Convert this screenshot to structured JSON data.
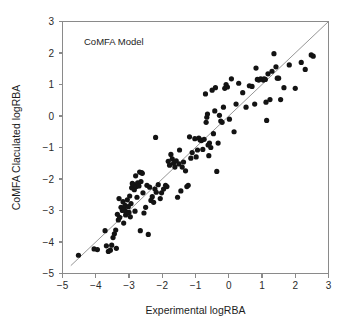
{
  "chart_data": {
    "type": "scatter",
    "title": "",
    "annotation": "CoMFA Model",
    "xlabel": "Experimental logRBA",
    "ylabel": "CoMFA Claculated logRBA",
    "xlim": [
      -5,
      3
    ],
    "ylim": [
      -5,
      3
    ],
    "xticks": [
      -5,
      -4,
      -3,
      -2,
      -1,
      0,
      1,
      2,
      3
    ],
    "yticks": [
      -5,
      -4,
      -3,
      -2,
      -1,
      0,
      1,
      2,
      3
    ],
    "xtick_labels": [
      "−5",
      "−4",
      "−3",
      "−2",
      "−1",
      "0",
      "1",
      "2",
      "3"
    ],
    "ytick_labels": [
      "−5",
      "−4",
      "−3",
      "−2",
      "−1",
      "0",
      "1",
      "2",
      "3"
    ],
    "grid": false,
    "legend": null,
    "point_color": "#131313",
    "line_color": "#8a8a8a",
    "axis_color": "#8a8a8a",
    "marker_size": 2.6,
    "reference_line": {
      "name": "identity-line",
      "slope": 1,
      "intercept": 0,
      "x_start": -4.75,
      "y_start": -4.75,
      "x_end": 3.0,
      "y_end": 3.0
    },
    "n_points": 146,
    "series": [
      {
        "name": "CoMFA predictions",
        "points": [
          [
            -4.52,
            -4.42
          ],
          [
            -4.05,
            -4.22
          ],
          [
            -3.95,
            -4.24
          ],
          [
            -3.72,
            -3.64
          ],
          [
            -3.68,
            -4.12
          ],
          [
            -3.62,
            -4.3
          ],
          [
            -3.56,
            -4.26
          ],
          [
            -3.52,
            -4.1
          ],
          [
            -3.48,
            -3.86
          ],
          [
            -3.44,
            -3.74
          ],
          [
            -3.4,
            -3.62
          ],
          [
            -3.38,
            -4.2
          ],
          [
            -3.35,
            -3.12
          ],
          [
            -3.32,
            -3.3
          ],
          [
            -3.3,
            -2.62
          ],
          [
            -3.28,
            -3.22
          ],
          [
            -3.24,
            -2.9
          ],
          [
            -3.2,
            -3.0
          ],
          [
            -3.18,
            -2.72
          ],
          [
            -3.16,
            -3.4
          ],
          [
            -3.14,
            -2.96
          ],
          [
            -3.12,
            -2.84
          ],
          [
            -3.1,
            -3.14
          ],
          [
            -3.08,
            -3.04
          ],
          [
            -3.05,
            -2.66
          ],
          [
            -3.02,
            -2.88
          ],
          [
            -3.0,
            -3.06
          ],
          [
            -2.98,
            -2.54
          ],
          [
            -2.96,
            -3.2
          ],
          [
            -2.94,
            -2.78
          ],
          [
            -2.92,
            -2.28
          ],
          [
            -2.9,
            -2.14
          ],
          [
            -2.88,
            -2.2
          ],
          [
            -2.86,
            -2.18
          ],
          [
            -2.84,
            -2.34
          ],
          [
            -2.82,
            -3.02
          ],
          [
            -2.8,
            -1.9
          ],
          [
            -2.78,
            -2.24
          ],
          [
            -2.76,
            -2.58
          ],
          [
            -2.74,
            -2.12
          ],
          [
            -2.72,
            -2.16
          ],
          [
            -2.7,
            -2.22
          ],
          [
            -2.68,
            -1.78
          ],
          [
            -2.66,
            -3.64
          ],
          [
            -2.64,
            -2.08
          ],
          [
            -2.62,
            -1.8
          ],
          [
            -2.6,
            -1.82
          ],
          [
            -2.58,
            -2.44
          ],
          [
            -2.55,
            -3.08
          ],
          [
            -2.5,
            -2.9
          ],
          [
            -2.46,
            -2.2
          ],
          [
            -2.42,
            -3.76
          ],
          [
            -2.38,
            -2.26
          ],
          [
            -2.34,
            -2.68
          ],
          [
            -2.3,
            -2.56
          ],
          [
            -2.26,
            -2.74
          ],
          [
            -2.22,
            -2.32
          ],
          [
            -2.2,
            -0.68
          ],
          [
            -2.18,
            -2.42
          ],
          [
            -2.12,
            -2.18
          ],
          [
            -2.06,
            -2.62
          ],
          [
            -2.02,
            -2.44
          ],
          [
            -1.96,
            -2.32
          ],
          [
            -1.9,
            -2.2
          ],
          [
            -1.86,
            -2.24
          ],
          [
            -1.82,
            -1.44
          ],
          [
            -1.78,
            -1.56
          ],
          [
            -1.74,
            -1.22
          ],
          [
            -1.7,
            -1.36
          ],
          [
            -1.66,
            -1.5
          ],
          [
            -1.62,
            -1.62
          ],
          [
            -1.58,
            -1.42
          ],
          [
            -1.54,
            -2.58
          ],
          [
            -1.5,
            -1.52
          ],
          [
            -1.48,
            -1.08
          ],
          [
            -1.44,
            -2.38
          ],
          [
            -1.4,
            -1.62
          ],
          [
            -1.36,
            -1.46
          ],
          [
            -1.3,
            -1.74
          ],
          [
            -1.26,
            -2.24
          ],
          [
            -1.22,
            -2.2
          ],
          [
            -1.18,
            -0.66
          ],
          [
            -1.14,
            -1.34
          ],
          [
            -1.1,
            -1.16
          ],
          [
            -1.02,
            -0.72
          ],
          [
            -0.98,
            -1.3
          ],
          [
            -0.94,
            -1.08
          ],
          [
            -0.9,
            -0.7
          ],
          [
            -0.86,
            -0.76
          ],
          [
            -0.82,
            -0.78
          ],
          [
            -0.78,
            -1.06
          ],
          [
            -0.74,
            -0.74
          ],
          [
            -0.7,
            0.7
          ],
          [
            -0.68,
            -0.2
          ],
          [
            -0.66,
            -0.04
          ],
          [
            -0.64,
            0.06
          ],
          [
            -0.62,
            -0.92
          ],
          [
            -0.6,
            -1.26
          ],
          [
            -0.58,
            -0.86
          ],
          [
            -0.54,
            -1.0
          ],
          [
            -0.5,
            0.82
          ],
          [
            -0.46,
            -0.56
          ],
          [
            -0.42,
            0.16
          ],
          [
            -0.4,
            0.9
          ],
          [
            -0.36,
            -1.76
          ],
          [
            -0.32,
            -0.86
          ],
          [
            -0.28,
            0.02
          ],
          [
            -0.24,
            -0.16
          ],
          [
            -0.2,
            -0.2
          ],
          [
            -0.16,
            0.28
          ],
          [
            -0.12,
            0.88
          ],
          [
            -0.08,
            1.0
          ],
          [
            -0.04,
            0.92
          ],
          [
            0.02,
            -0.1
          ],
          [
            0.08,
            1.18
          ],
          [
            0.16,
            -0.5
          ],
          [
            0.22,
            0.38
          ],
          [
            0.3,
            1.04
          ],
          [
            0.42,
            0.74
          ],
          [
            0.52,
            0.28
          ],
          [
            0.62,
            0.96
          ],
          [
            0.7,
            0.94
          ],
          [
            0.78,
            0.38
          ],
          [
            0.82,
            1.52
          ],
          [
            0.86,
            1.16
          ],
          [
            0.9,
            1.14
          ],
          [
            0.96,
            1.18
          ],
          [
            1.04,
            1.14
          ],
          [
            1.06,
            1.18
          ],
          [
            1.1,
            1.16
          ],
          [
            1.12,
            0.44
          ],
          [
            1.14,
            -0.14
          ],
          [
            1.18,
            1.34
          ],
          [
            1.24,
            0.52
          ],
          [
            1.3,
            1.42
          ],
          [
            1.36,
            1.98
          ],
          [
            1.42,
            1.56
          ],
          [
            1.46,
            1.2
          ],
          [
            1.5,
            1.2
          ],
          [
            1.56,
            0.52
          ],
          [
            1.66,
            0.9
          ],
          [
            1.82,
            1.62
          ],
          [
            2.0,
            0.88
          ],
          [
            2.18,
            1.7
          ],
          [
            2.3,
            1.48
          ],
          [
            2.48,
            1.94
          ],
          [
            2.54,
            1.9
          ]
        ]
      }
    ]
  },
  "figure": {
    "background_color": "#ffffff"
  }
}
